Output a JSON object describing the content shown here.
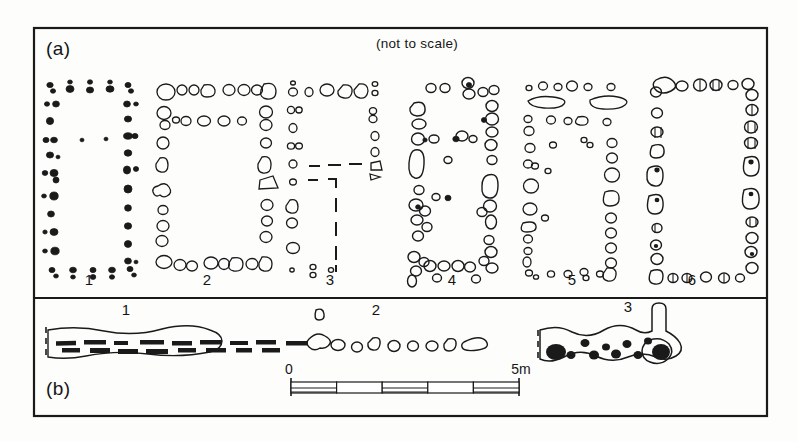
{
  "figure": {
    "background_color": "#fdfdfc",
    "ink_color": "#1a1a1a",
    "frame": {
      "x": 34,
      "y": 28,
      "width": 733,
      "height": 388
    },
    "panel_divider_y": 298
  },
  "panels": [
    {
      "id": "a",
      "label": "(a)",
      "label_pos": {
        "x": 46,
        "y": 55
      },
      "note": "(not to scale)",
      "note_pos": {
        "x": 417,
        "y": 48
      },
      "plans": [
        {
          "number": "1",
          "label_pos": {
            "x": 89,
            "y": 285
          },
          "style": "filled-small",
          "cx": 89,
          "cy": 172,
          "w": 88,
          "h": 190
        },
        {
          "number": "2",
          "label_pos": {
            "x": 207,
            "y": 285
          },
          "style": "open-large",
          "cx": 207,
          "cy": 172,
          "w": 102,
          "h": 190
        },
        {
          "number": "3",
          "label_pos": {
            "x": 330,
            "y": 285
          },
          "style": "open-dashed",
          "cx": 330,
          "cy": 172,
          "w": 92,
          "h": 190
        },
        {
          "number": "4",
          "label_pos": {
            "x": 452,
            "y": 285
          },
          "style": "dense-cluster",
          "cx": 452,
          "cy": 172,
          "w": 96,
          "h": 196
        },
        {
          "number": "5",
          "label_pos": {
            "x": 572,
            "y": 285
          },
          "style": "open-slab",
          "cx": 572,
          "cy": 172,
          "w": 96,
          "h": 190
        },
        {
          "number": "6",
          "label_pos": {
            "x": 692,
            "y": 285
          },
          "style": "detailed-stone",
          "cx": 692,
          "cy": 170,
          "w": 92,
          "h": 192
        }
      ]
    },
    {
      "id": "b",
      "label": "(b)",
      "label_pos": {
        "x": 46,
        "y": 395
      },
      "items": [
        {
          "number": "1",
          "label_pos": {
            "x": 126,
            "y": 315
          },
          "style": "slab-wall"
        },
        {
          "number": "2",
          "label_pos": {
            "x": 376,
            "y": 315
          },
          "style": "stone-row"
        },
        {
          "number": "3",
          "label_pos": {
            "x": 628,
            "y": 312
          },
          "style": "posthole-wall"
        }
      ],
      "scale_bar": {
        "start_label": "0",
        "end_label": "5m",
        "start_pos": {
          "x": 289,
          "y": 374
        },
        "end_pos": {
          "x": 521,
          "y": 374
        },
        "bar": {
          "x": 291,
          "y": 382,
          "width": 228,
          "height": 12
        },
        "divisions": 5
      }
    }
  ]
}
